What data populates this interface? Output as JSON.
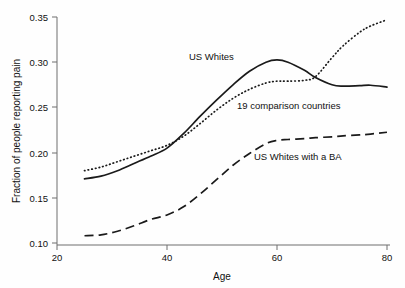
{
  "chart_data": {
    "type": "line",
    "title": "",
    "xlabel": "Age",
    "ylabel": "Fraction of people reporting pain",
    "xlim": [
      20,
      80
    ],
    "ylim": [
      0.1,
      0.35
    ],
    "xticks": [
      "20",
      "40",
      "60",
      "80"
    ],
    "yticks": [
      "0.10",
      "0.15",
      "0.20",
      "0.25",
      "0.30",
      "0.35"
    ],
    "grid": false,
    "legend_position": "inline-annotations",
    "x": [
      25,
      28,
      31,
      34,
      37,
      40,
      43,
      46,
      49,
      52,
      55,
      58,
      60,
      62,
      65,
      67,
      70,
      72,
      75,
      77,
      80
    ],
    "series": [
      {
        "name": "US Whites",
        "style": "solid",
        "label_text": "US Whites",
        "values": [
          0.171,
          0.174,
          0.18,
          0.188,
          0.196,
          0.205,
          0.221,
          0.24,
          0.258,
          0.275,
          0.29,
          0.3,
          0.3025,
          0.3,
          0.291,
          0.283,
          0.275,
          0.2735,
          0.274,
          0.2745,
          0.2725
        ]
      },
      {
        "name": "19 comparison countries",
        "style": "dotted",
        "label_text": "19 comparison countries",
        "values": [
          0.18,
          0.184,
          0.19,
          0.196,
          0.202,
          0.208,
          0.218,
          0.232,
          0.247,
          0.26,
          0.27,
          0.277,
          0.279,
          0.279,
          0.28,
          0.284,
          0.305,
          0.318,
          0.333,
          0.34,
          0.347
        ]
      },
      {
        "name": "US Whites with a BA",
        "style": "dashed",
        "label_text": "US Whites with a BA",
        "values": [
          0.108,
          0.109,
          0.113,
          0.119,
          0.126,
          0.131,
          0.14,
          0.154,
          0.17,
          0.186,
          0.199,
          0.21,
          0.2135,
          0.2145,
          0.2155,
          0.2165,
          0.2175,
          0.2185,
          0.2195,
          0.2205,
          0.2225
        ]
      }
    ],
    "annotations": [
      {
        "text": "US Whites",
        "x_px": 189,
        "y_px": 60
      },
      {
        "text": "19 comparison countries",
        "x_px": 237,
        "y_px": 109
      },
      {
        "text": "US Whites with a BA",
        "x_px": 254,
        "y_px": 160
      }
    ]
  }
}
